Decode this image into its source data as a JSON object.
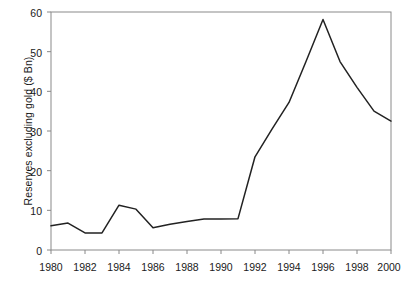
{
  "chart_data": {
    "type": "line",
    "title": "",
    "xlabel": "",
    "ylabel": "Reserves excluding gold ($ Bn)",
    "xlim": [
      1980,
      2000
    ],
    "ylim": [
      0,
      60
    ],
    "grid": false,
    "legend": null,
    "x_ticks": [
      "1980",
      "1982",
      "1984",
      "1986",
      "1988",
      "1990",
      "1992",
      "1994",
      "1996",
      "1998",
      "2000"
    ],
    "y_ticks": [
      "0",
      "10",
      "20",
      "30",
      "40",
      "50",
      "60"
    ],
    "x": [
      1980,
      1981,
      1982,
      1983,
      1984,
      1985,
      1986,
      1987,
      1988,
      1989,
      1990,
      1991,
      1992,
      1993,
      1994,
      1995,
      1996,
      1997,
      1998,
      1999,
      2000
    ],
    "values": [
      6.1,
      6.8,
      4.3,
      4.3,
      11.3,
      10.3,
      5.6,
      6.5,
      7.2,
      7.8,
      7.8,
      7.9,
      23.5,
      30.5,
      37.2,
      47.5,
      58.1,
      47.5,
      41.0,
      35.0,
      32.5
    ],
    "series": [
      {
        "name": "Reserves excluding gold",
        "color": "#222222",
        "values": [
          6.1,
          6.8,
          4.3,
          4.3,
          11.3,
          10.3,
          5.6,
          6.5,
          7.2,
          7.8,
          7.8,
          7.9,
          23.5,
          30.5,
          37.2,
          47.5,
          58.1,
          47.5,
          41.0,
          35.0,
          32.5
        ]
      }
    ]
  },
  "axes": {
    "frame_color": "#888888",
    "line_color": "#222222",
    "text_color": "#1a1a1a"
  }
}
